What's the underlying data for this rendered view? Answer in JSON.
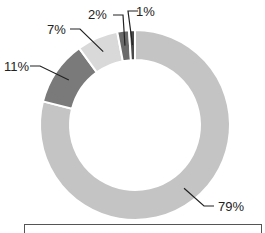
{
  "chart_data": {
    "type": "pie",
    "variant": "donut",
    "title": "",
    "categories": [
      "Segment A",
      "Segment B",
      "Segment C",
      "Segment D",
      "Segment E"
    ],
    "values": [
      79,
      11,
      7,
      2,
      1
    ],
    "labels": [
      "79%",
      "11%",
      "7%",
      "2%",
      "1%"
    ],
    "colors": [
      "#c4c4c4",
      "#7a7a7a",
      "#d9d9d9",
      "#6a6a6a",
      "#4a4a4a"
    ],
    "start_angle_deg": 0,
    "direction": "clockwise",
    "legend_position": "bottom",
    "legend_visible_text": ""
  },
  "labels": {
    "seg0": "79%",
    "seg1": "11%",
    "seg2": "7%",
    "seg3": "2%",
    "seg4": "1%"
  }
}
